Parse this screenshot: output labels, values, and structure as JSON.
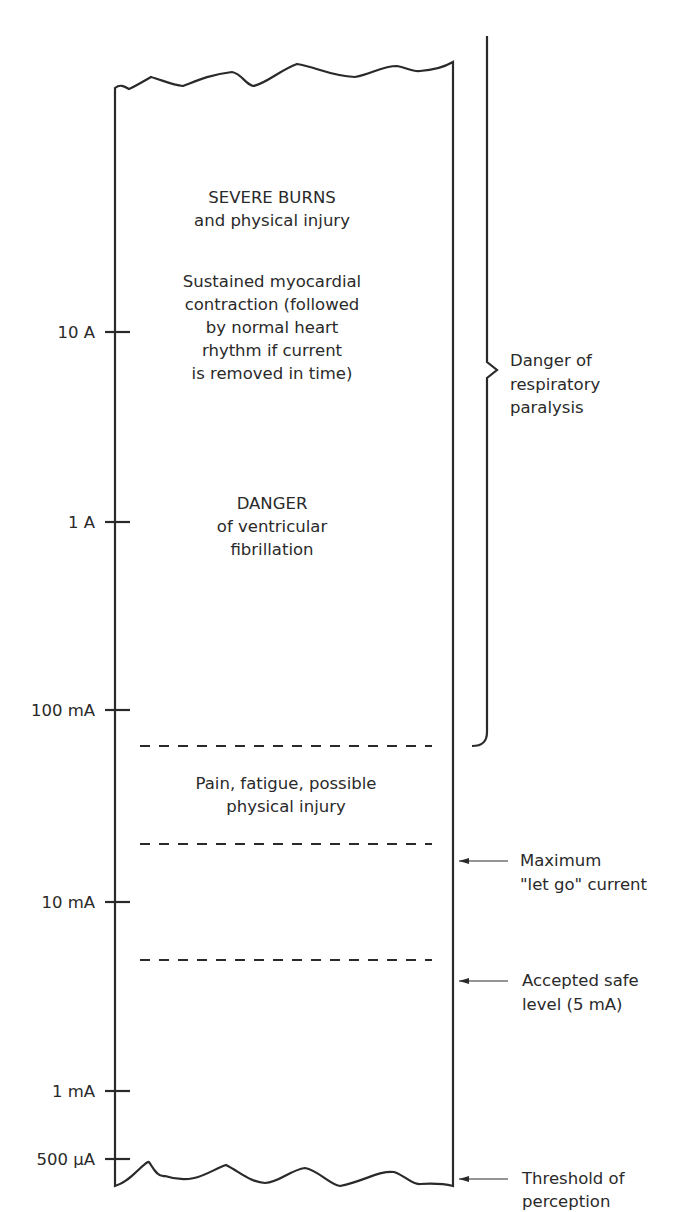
{
  "figure": {
    "axis_ticks": [
      {
        "label": "10 A"
      },
      {
        "label": "1 A"
      },
      {
        "label": "100 mA"
      },
      {
        "label": "10 mA"
      },
      {
        "label": "1 mA"
      },
      {
        "label": "500 µA"
      }
    ],
    "zones": [
      {
        "lines": [
          "SEVERE BURNS",
          "and physical injury"
        ]
      },
      {
        "lines": [
          "Sustained myocardial",
          "contraction (followed",
          "by normal heart",
          "rhythm if current",
          "is removed in time)"
        ]
      },
      {
        "lines": [
          "DANGER",
          "of ventricular",
          "fibrillation"
        ]
      },
      {
        "lines": [
          "Pain, fatigue, possible",
          "physical injury"
        ]
      }
    ],
    "bracket_annotation": {
      "lines": [
        "Danger of",
        "respiratory",
        "paralysis"
      ]
    },
    "arrow_annotations": [
      {
        "lines": [
          "Maximum",
          "\"let go\" current"
        ]
      },
      {
        "lines": [
          "Accepted safe",
          "level (5 mA)"
        ]
      },
      {
        "lines": [
          "Threshold of",
          "perception"
        ]
      }
    ]
  }
}
